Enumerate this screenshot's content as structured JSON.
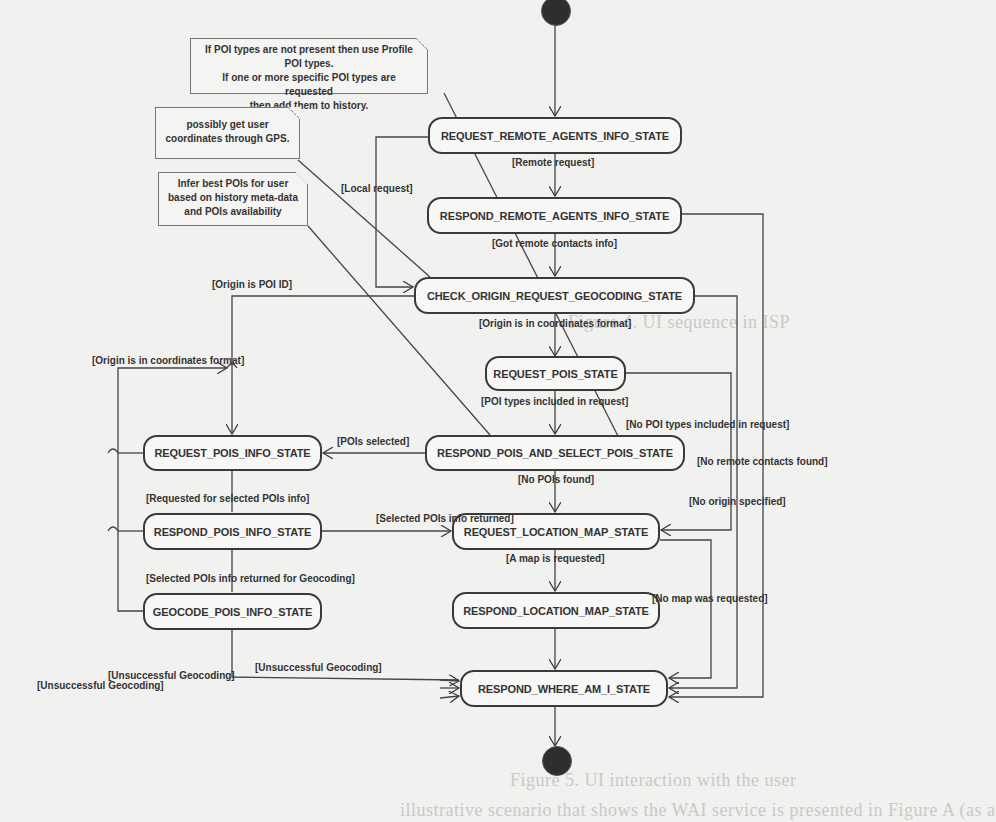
{
  "diagram": {
    "type": "UML state machine diagram",
    "initial_node": "initial-state",
    "final_node": "final-state",
    "states": [
      {
        "id": "s1",
        "label": "REQUEST_REMOTE_AGENTS_INFO_STATE"
      },
      {
        "id": "s2",
        "label": "RESPOND_REMOTE_AGENTS_INFO_STATE"
      },
      {
        "id": "s3",
        "label": "CHECK_ORIGIN_REQUEST_GEOCODING_STATE"
      },
      {
        "id": "s4",
        "label": "REQUEST_POIS_STATE"
      },
      {
        "id": "s5",
        "label": "RESPOND_POIS_AND_SELECT_POIS_STATE"
      },
      {
        "id": "s6",
        "label": "REQUEST_POIS_INFO_STATE"
      },
      {
        "id": "s7",
        "label": "RESPOND_POIS_INFO_STATE"
      },
      {
        "id": "s8",
        "label": "GEOCODE_POIS_INFO_STATE"
      },
      {
        "id": "s9",
        "label": "REQUEST_LOCATION_MAP_STATE"
      },
      {
        "id": "s10",
        "label": "RESPOND_LOCATION_MAP_STATE"
      },
      {
        "id": "s11",
        "label": "RESPOND_WHERE_AM_I_STATE"
      }
    ],
    "notes": [
      {
        "id": "n1",
        "text": "If POI types are not present then use Profile POI types. If one or more specific POI types are requested then add them to history.",
        "lines": [
          "If POI types are not present then use Profile POI types.",
          "If one or more specific POI types are requested",
          "then add them to history."
        ]
      },
      {
        "id": "n2",
        "text": "possibly get user coordinates through GPS.",
        "lines": [
          "possibly get user",
          "coordinates through GPS."
        ]
      },
      {
        "id": "n3",
        "text": "Infer best POIs for user based on history meta-data and POIs availability",
        "lines": [
          "Infer best POIs for user",
          "based on history meta-data",
          "and POIs availability"
        ]
      }
    ],
    "guards": {
      "remote_request": "[Remote request]",
      "local_request": "[Local request]",
      "got_remote_contacts": "[Got remote contacts info]",
      "origin_poi_id": "[Origin is POI ID]",
      "origin_coords_main": "[Origin is in coordinates format]",
      "origin_coords_left": "[Origin is in coordinates format]",
      "poi_types_included": "[POI types included in request]",
      "no_poi_types": "[No POI types included in request]",
      "pois_selected": "[POIs selected]",
      "no_remote_contacts": "[No remote contacts found]",
      "no_pois_found": "[No POIs found]",
      "requested_selected_info": "[Requested for selected POIs info]",
      "selected_info_returned": "[Selected POIs info returned]",
      "no_origin": "[No origin specified]",
      "map_requested": "[A map is requested]",
      "selected_info_geocoding": "[Selected POIs info returned for Geocoding]",
      "no_map": "[No map was requested]",
      "unsuccessful_geocoding_1": "[Unsuccessful Geocoding]",
      "unsuccessful_geocoding_2": "[Unsuccessful Geocoding]",
      "unsuccessful_geocoding_3": "[Unsuccessful Geocoding]"
    },
    "transitions": [
      {
        "from": "initial",
        "to": "s1"
      },
      {
        "from": "s1",
        "to": "s2",
        "guard": "[Remote request]"
      },
      {
        "from": "s1",
        "to": "s3",
        "guard": "[Local request]"
      },
      {
        "from": "s2",
        "to": "s3",
        "guard": "[Got remote contacts info]"
      },
      {
        "from": "s2",
        "to": "s11",
        "guard": "[No remote contacts found]"
      },
      {
        "from": "s3",
        "to": "s4",
        "guard": "[Origin is in coordinates format]"
      },
      {
        "from": "s3",
        "to": "s6",
        "guard": "[Origin is POI ID]"
      },
      {
        "from": "s3",
        "to": "s11",
        "guard": "[No origin specified]"
      },
      {
        "from": "s4",
        "to": "s5",
        "guard": "[POI types included in request]"
      },
      {
        "from": "s4",
        "to": "s9",
        "guard": "[No POI types included in request]"
      },
      {
        "from": "s5",
        "to": "s6",
        "guard": "[POIs selected]"
      },
      {
        "from": "s5",
        "to": "s9",
        "guard": "[No POIs found]"
      },
      {
        "from": "s6",
        "to": "s7",
        "guard": "[Requested for selected POIs info]"
      },
      {
        "from": "s6",
        "to": "s11",
        "guard": "[Unsuccessful Geocoding]"
      },
      {
        "from": "s7",
        "to": "s8",
        "guard": "[Selected POIs info returned for Geocoding]"
      },
      {
        "from": "s7",
        "to": "s9",
        "guard": "[Selected POIs info returned]"
      },
      {
        "from": "s7",
        "to": "s11",
        "guard": "[Unsuccessful Geocoding]"
      },
      {
        "from": "s8",
        "to": "s4",
        "guard": "[Origin is in coordinates format]"
      },
      {
        "from": "s8",
        "to": "s11",
        "guard": "[Unsuccessful Geocoding]"
      },
      {
        "from": "s9",
        "to": "s10",
        "guard": "[A map is requested]"
      },
      {
        "from": "s9",
        "to": "s11",
        "guard": "[No map was requested]"
      },
      {
        "from": "s10",
        "to": "s11"
      },
      {
        "from": "s11",
        "to": "final"
      }
    ]
  },
  "background_bleed": {
    "line1": "Figure 4. UI sequence in ISP",
    "line2": "Figure 5. UI interaction with the user",
    "line3": "illustrative scenario that shows the WAI service is presented in Figure A (as a"
  },
  "colors": {
    "background": "#f1f1ef",
    "ink": "#333333",
    "state_fill": "#f7f7f5",
    "node_fill": "#2e2e2e"
  }
}
